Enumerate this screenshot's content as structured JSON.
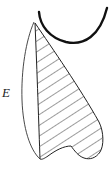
{
  "diagram": {
    "labels": {
      "e": "E"
    },
    "colors": {
      "stroke": "#111111",
      "background": "#ffffff"
    },
    "elements": [
      {
        "name": "u-curve",
        "description": "thick black U-shaped curve at top"
      },
      {
        "name": "outer-sliver",
        "description": "unshaded left crescent region"
      },
      {
        "name": "hatched-region",
        "description": "diagonally hatched main region with notch at bottom"
      }
    ]
  }
}
